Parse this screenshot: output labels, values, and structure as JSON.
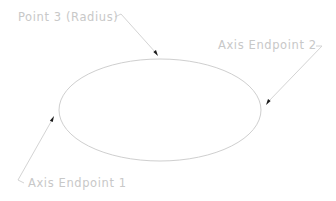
{
  "diagram": {
    "type": "ellipse-construction",
    "colors": {
      "background": "#ffffff",
      "ellipse_stroke": "#cfcfcf",
      "leader_stroke": "#d4d4d4",
      "arrowhead": "#1a1a1a",
      "label_text": "#c8c8c8"
    },
    "ellipse": {
      "cx": 160,
      "cy": 110,
      "rx": 101,
      "ry": 51
    },
    "labels": [
      {
        "id": "point3",
        "text": "Point 3 (Radius)",
        "x": 18,
        "y": 21
      },
      {
        "id": "endpoint2",
        "text": "Axis Endpoint 2",
        "x": 218,
        "y": 49
      },
      {
        "id": "endpoint1",
        "text": "Axis Endpoint 1",
        "x": 28,
        "y": 187
      }
    ],
    "leaders": [
      {
        "id": "point3",
        "points": "115,17 121,14 156,53",
        "arrow_tip": [
          158,
          56
        ]
      },
      {
        "id": "endpoint2",
        "points": "316,46 322,46 268,102",
        "arrow_tip": [
          266,
          105
        ]
      },
      {
        "id": "endpoint1",
        "points": "24,183 18,180 52,120",
        "arrow_tip": [
          54,
          116
        ]
      }
    ]
  }
}
